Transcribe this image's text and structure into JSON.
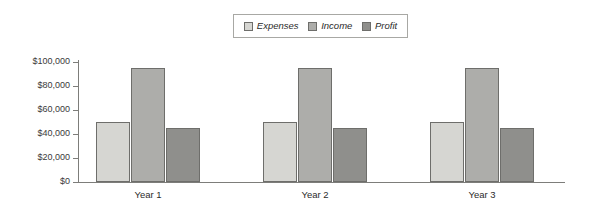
{
  "chart_data": {
    "type": "bar",
    "title": "",
    "xlabel": "",
    "ylabel": "",
    "categories": [
      "Year 1",
      "Year 2",
      "Year 3"
    ],
    "series": [
      {
        "name": "Expenses",
        "color": "#d6d6d2",
        "values": [
          50000,
          50000,
          50000
        ]
      },
      {
        "name": "Income",
        "color": "#adadaa",
        "values": [
          95000,
          95000,
          95000
        ]
      },
      {
        "name": "Profit",
        "color": "#8f8f8c",
        "values": [
          45000,
          45000,
          45000
        ]
      }
    ],
    "ylim": [
      0,
      100000
    ],
    "ytick_values": [
      0,
      20000,
      40000,
      60000,
      80000,
      100000
    ],
    "ytick_labels": [
      "$0",
      "$20,000",
      "$40,000",
      "$60,000",
      "$80,000",
      "$100,000"
    ],
    "grid": false,
    "legend_position": "top-center",
    "legend_entries": [
      "Expenses",
      "Income",
      "Profit"
    ]
  },
  "legend": {
    "items": [
      {
        "label": "Expenses",
        "swatch_color": "#d6d6d2"
      },
      {
        "label": "Income",
        "swatch_color": "#adadaa"
      },
      {
        "label": "Profit",
        "swatch_color": "#8f8f8c"
      }
    ]
  },
  "axis": {
    "y_labels": [
      "$100,000",
      "$80,000",
      "$60,000",
      "$40,000",
      "$20,000",
      "$0"
    ],
    "x_labels": [
      "Year 1",
      "Year 2",
      "Year 3"
    ]
  }
}
